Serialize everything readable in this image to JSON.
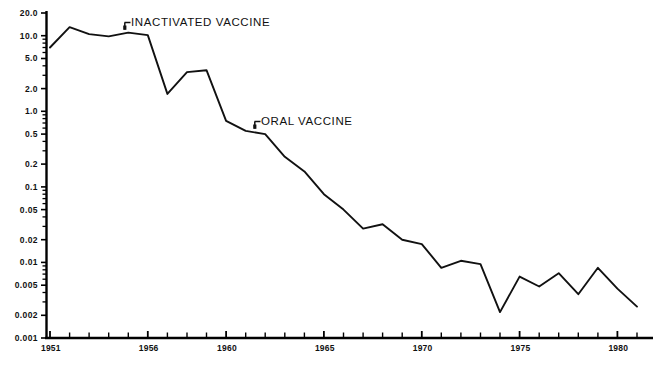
{
  "chart_data": {
    "type": "line",
    "title": "",
    "xlabel": "",
    "ylabel": "",
    "yscale": "log",
    "ylim": [
      0.001,
      20.0
    ],
    "xlim": [
      1951,
      1981
    ],
    "grid": false,
    "legend": "none",
    "y_tick_labels": [
      "20.0",
      "10.0",
      "5.0",
      "2.0",
      "1.0",
      "0.5",
      "0.2",
      "0.1",
      "0.05",
      "0.02",
      "0.01",
      "0.005",
      "0.002",
      "0.001"
    ],
    "y_tick_values": [
      20.0,
      10.0,
      5.0,
      2.0,
      1.0,
      0.5,
      0.2,
      0.1,
      0.05,
      0.02,
      0.01,
      0.005,
      0.002,
      0.001
    ],
    "x_tick_labels": [
      "1951",
      "1956",
      "1960",
      "1965",
      "1970",
      "1975",
      "1980"
    ],
    "x_tick_values": [
      1951,
      1956,
      1960,
      1965,
      1970,
      1975,
      1980
    ],
    "x_minor_step": 1,
    "series": [
      {
        "name": "Paralytic poliomyelitis rate",
        "x": [
          1951,
          1952,
          1953,
          1954,
          1955,
          1956,
          1957,
          1958,
          1959,
          1960,
          1961,
          1962,
          1963,
          1964,
          1965,
          1966,
          1967,
          1968,
          1969,
          1970,
          1971,
          1972,
          1973,
          1974,
          1975,
          1976,
          1977,
          1978,
          1979,
          1980,
          1981
        ],
        "values": [
          7.0,
          13.0,
          10.5,
          9.8,
          11.0,
          10.2,
          1.7,
          3.3,
          3.5,
          0.75,
          0.55,
          0.5,
          0.25,
          0.16,
          0.08,
          0.05,
          0.028,
          0.032,
          0.02,
          0.0175,
          0.0085,
          0.0105,
          0.0095,
          0.0022,
          0.0065,
          0.0048,
          0.0072,
          0.0038,
          0.0085,
          0.0045,
          0.0026
        ]
      }
    ],
    "annotations": [
      {
        "label": "INACTIVATED VACCINE",
        "x": 1956,
        "y": 10.2,
        "pointer": "bracket-left"
      },
      {
        "label": "ORAL VACCINE",
        "x": 1961.5,
        "y": 0.52,
        "pointer": "bracket-left"
      }
    ]
  },
  "axes": {
    "y_labels": [
      "20.0",
      "10.0",
      "5.0",
      "2.0",
      "1.0",
      "0.5",
      "0.2",
      "0.1",
      "0.05",
      "0.02",
      "0.01",
      "0.005",
      "0.002",
      "0.001"
    ],
    "x_labels": [
      "1951",
      "1956",
      "1960",
      "1965",
      "1970",
      "1975",
      "1980"
    ]
  },
  "annotations": {
    "inactivated": "INACTIVATED VACCINE",
    "oral": "ORAL VACCINE"
  },
  "colors": {
    "line": "#111111",
    "axis": "#000000",
    "background": "#ffffff"
  }
}
